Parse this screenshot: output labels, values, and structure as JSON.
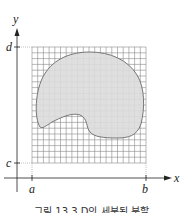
{
  "figure": {
    "caption": "그림 13.3 D의 세분된 분할",
    "axes": {
      "x_label": "x",
      "y_label": "y",
      "x_ticks": [
        "a",
        "b"
      ],
      "y_ticks": [
        "c",
        "d"
      ]
    },
    "grid": {
      "columns": 20,
      "rows": 20,
      "line_color": "#8a8a8a"
    },
    "region": {
      "name": "D",
      "fill": "#dcdcdc",
      "stroke": "#777777"
    },
    "colors": {
      "axis": "#222222",
      "background": "#ffffff"
    }
  }
}
